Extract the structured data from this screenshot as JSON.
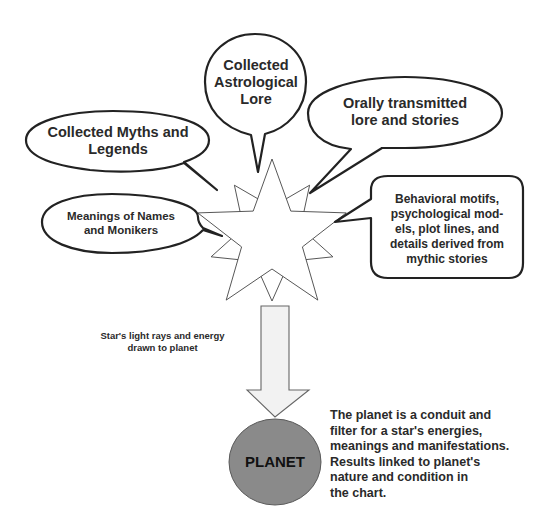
{
  "diagram": {
    "bubbles": [
      {
        "id": "astrological-lore",
        "text": "Collected\nAstrological\nLore"
      },
      {
        "id": "myths-legends",
        "text": "Collected Myths and\nLegends"
      },
      {
        "id": "oral-lore",
        "text": "Orally transmitted\nlore and stories"
      },
      {
        "id": "names-monikers",
        "text": "Meanings of Names\nand Monikers"
      },
      {
        "id": "behavioral-motifs",
        "text": "Behavioral motifs,\npsychological mod-\nels, plot lines, and\ndetails derived from\nmythic stories"
      }
    ],
    "center_icon": "star-icon",
    "arrow_label": "Star's light rays and energy\ndrawn to planet",
    "planet_label": "PLANET",
    "planet_note": "The planet is a conduit and\nfilter for a star's   energies,\nmeanings and manifestations.\nResults linked to planet's\nnature and condition in\nthe chart.",
    "colors": {
      "outline": "#222222",
      "planet_fill": "#8a8a8a",
      "arrow_fill": "#f2f2f2",
      "star_fill": "#ffffff",
      "text": "#2a2a2a"
    }
  }
}
